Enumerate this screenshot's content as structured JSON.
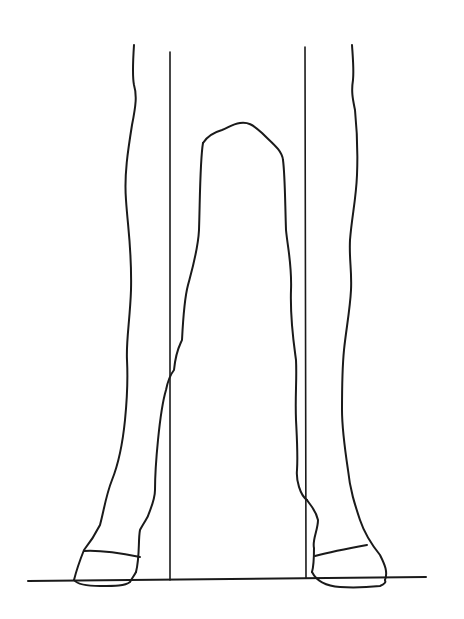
{
  "figure": {
    "background": "#ffffff",
    "line_color": "#1a1a1a",
    "elements": [
      "left-foreleg",
      "right-foreleg",
      "left-plumb-line",
      "right-plumb-line",
      "ground-line"
    ]
  }
}
